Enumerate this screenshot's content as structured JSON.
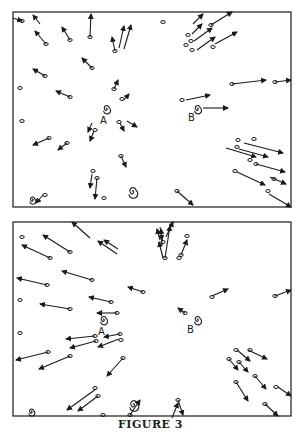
{
  "caption": "FIGURE 3",
  "colors": {
    "ink": "#1a1a1a",
    "background": "#ffffff"
  },
  "panels": [
    {
      "name": "top-panel",
      "frame": [
        13,
        12,
        291,
        207
      ],
      "labels": [
        {
          "text": "A",
          "x": 100,
          "y": 124
        },
        {
          "text": "B",
          "x": 188,
          "y": 121
        }
      ],
      "spirals": [
        {
          "x": 106,
          "y": 109,
          "r": 3.5
        },
        {
          "x": 197,
          "y": 109,
          "r": 3.5
        },
        {
          "x": 132,
          "y": 192,
          "r": 4.5
        },
        {
          "x": 32,
          "y": 200,
          "r": 3
        }
      ],
      "arrows": [
        [
          40,
          24,
          33,
          15
        ],
        [
          46,
          44,
          35,
          31
        ],
        [
          70,
          40,
          62,
          27
        ],
        [
          90,
          37,
          91,
          14
        ],
        [
          115,
          51,
          112,
          37
        ],
        [
          119,
          48,
          124,
          26
        ],
        [
          124,
          49,
          131,
          25
        ],
        [
          92,
          68,
          82,
          58
        ],
        [
          45,
          76,
          33,
          69
        ],
        [
          70,
          97,
          56,
          91
        ],
        [
          114,
          89,
          118,
          80
        ],
        [
          124,
          100,
          129,
          94
        ],
        [
          92,
          123,
          88,
          132
        ],
        [
          94,
          131,
          90,
          141
        ],
        [
          120,
          123,
          124,
          131
        ],
        [
          127,
          121,
          137,
          127
        ],
        [
          49,
          138,
          33,
          145
        ],
        [
          67,
          143,
          58,
          150
        ],
        [
          121,
          156,
          126,
          167
        ],
        [
          92,
          174,
          90,
          188
        ],
        [
          97,
          178,
          95,
          199
        ],
        [
          43,
          195,
          36,
          203
        ],
        [
          13,
          18,
          22,
          21
        ],
        [
          193,
          24,
          203,
          14
        ],
        [
          192,
          34,
          202,
          24
        ],
        [
          194,
          41,
          212,
          28
        ],
        [
          211,
          25,
          232,
          12
        ],
        [
          197,
          50,
          215,
          37
        ],
        [
          215,
          44,
          237,
          32
        ],
        [
          232,
          84,
          266,
          80
        ],
        [
          275,
          82,
          291,
          80
        ],
        [
          186,
          100,
          210,
          95
        ],
        [
          203,
          108,
          228,
          108
        ],
        [
          244,
          143,
          283,
          153
        ],
        [
          239,
          149,
          268,
          157
        ],
        [
          226,
          148,
          256,
          157
        ],
        [
          256,
          164,
          285,
          172
        ],
        [
          237,
          172,
          265,
          185
        ],
        [
          270,
          177,
          286,
          184
        ],
        [
          269,
          194,
          291,
          207
        ],
        [
          177,
          191,
          193,
          205
        ]
      ],
      "blobs": [
        [
          22,
          21
        ],
        [
          46,
          44
        ],
        [
          70,
          40
        ],
        [
          90,
          37
        ],
        [
          115,
          51
        ],
        [
          92,
          68
        ],
        [
          45,
          76
        ],
        [
          70,
          97
        ],
        [
          20,
          88
        ],
        [
          22,
          121
        ],
        [
          114,
          89
        ],
        [
          122,
          99
        ],
        [
          95,
          130
        ],
        [
          119,
          122
        ],
        [
          49,
          138
        ],
        [
          67,
          143
        ],
        [
          121,
          156
        ],
        [
          93,
          171
        ],
        [
          97,
          178
        ],
        [
          104,
          198
        ],
        [
          45,
          195
        ],
        [
          163,
          22
        ],
        [
          188,
          35
        ],
        [
          186,
          45
        ],
        [
          191,
          41
        ],
        [
          192,
          50
        ],
        [
          211,
          25
        ],
        [
          213,
          47
        ],
        [
          232,
          84
        ],
        [
          275,
          82
        ],
        [
          182,
          100
        ],
        [
          238,
          140
        ],
        [
          254,
          139
        ],
        [
          237,
          147
        ],
        [
          250,
          160
        ],
        [
          256,
          164
        ],
        [
          235,
          171
        ],
        [
          274,
          179
        ],
        [
          268,
          191
        ],
        [
          177,
          191
        ]
      ]
    },
    {
      "name": "bottom-panel",
      "frame": [
        13,
        222,
        291,
        416
      ],
      "labels": [
        {
          "text": "A",
          "x": 98,
          "y": 335
        },
        {
          "text": "B",
          "x": 187,
          "y": 333
        }
      ],
      "spirals": [
        {
          "x": 197,
          "y": 320,
          "r": 3.5
        },
        {
          "x": 103,
          "y": 320,
          "r": 3.5
        },
        {
          "x": 133,
          "y": 405,
          "r": 4.5
        },
        {
          "x": 31,
          "y": 412,
          "r": 3
        }
      ],
      "arrows": [
        [
          50,
          258,
          22,
          245
        ],
        [
          70,
          252,
          43,
          235
        ],
        [
          90,
          238,
          72,
          222
        ],
        [
          117,
          254,
          98,
          241
        ],
        [
          118,
          249,
          104,
          240
        ],
        [
          92,
          280,
          62,
          271
        ],
        [
          47,
          285,
          17,
          278
        ],
        [
          70,
          309,
          40,
          304
        ],
        [
          143,
          292,
          128,
          287
        ],
        [
          111,
          302,
          89,
          297
        ],
        [
          117,
          313,
          97,
          313
        ],
        [
          120,
          334,
          104,
          337
        ],
        [
          95,
          336,
          66,
          339
        ],
        [
          96,
          341,
          70,
          348
        ],
        [
          119,
          339,
          98,
          347
        ],
        [
          48,
          352,
          16,
          360
        ],
        [
          70,
          356,
          39,
          369
        ],
        [
          123,
          358,
          107,
          376
        ],
        [
          96,
          389,
          67,
          410
        ],
        [
          98,
          396,
          78,
          411
        ],
        [
          130,
          415,
          140,
          400
        ],
        [
          172,
          418,
          178,
          403
        ],
        [
          160,
          240,
          157,
          229
        ],
        [
          162,
          245,
          161,
          229
        ],
        [
          165,
          258,
          170,
          226
        ],
        [
          181,
          255,
          187,
          240
        ],
        [
          166,
          237,
          173,
          222
        ],
        [
          163,
          258,
          159,
          242
        ],
        [
          212,
          296,
          228,
          289
        ],
        [
          275,
          296,
          291,
          290
        ],
        [
          185,
          313,
          178,
          308
        ],
        [
          237,
          350,
          250,
          361
        ],
        [
          248,
          350,
          267,
          359
        ],
        [
          229,
          359,
          238,
          370
        ],
        [
          239,
          362,
          248,
          372
        ],
        [
          255,
          376,
          266,
          389
        ],
        [
          236,
          382,
          248,
          401
        ],
        [
          278,
          387,
          291,
          396
        ],
        [
          265,
          404,
          278,
          416
        ],
        [
          160,
          227,
          162,
          240
        ],
        [
          178,
          400,
          183,
          415
        ]
      ],
      "blobs": [
        [
          22,
          237
        ],
        [
          70,
          252
        ],
        [
          50,
          258
        ],
        [
          92,
          280
        ],
        [
          47,
          285
        ],
        [
          20,
          300
        ],
        [
          20,
          333
        ],
        [
          70,
          309
        ],
        [
          143,
          292
        ],
        [
          111,
          302
        ],
        [
          117,
          313
        ],
        [
          120,
          334
        ],
        [
          96,
          341
        ],
        [
          95,
          336
        ],
        [
          121,
          340
        ],
        [
          48,
          352
        ],
        [
          70,
          356
        ],
        [
          123,
          358
        ],
        [
          95,
          388
        ],
        [
          98,
          396
        ],
        [
          130,
          415
        ],
        [
          163,
          242
        ],
        [
          165,
          258
        ],
        [
          179,
          258
        ],
        [
          181,
          255
        ],
        [
          187,
          236
        ],
        [
          212,
          297
        ],
        [
          275,
          296
        ],
        [
          185,
          313
        ],
        [
          236,
          350
        ],
        [
          250,
          350
        ],
        [
          229,
          359
        ],
        [
          239,
          362
        ],
        [
          255,
          376
        ],
        [
          236,
          382
        ],
        [
          276,
          387
        ],
        [
          265,
          404
        ],
        [
          178,
          400
        ],
        [
          103,
          415
        ]
      ]
    }
  ]
}
